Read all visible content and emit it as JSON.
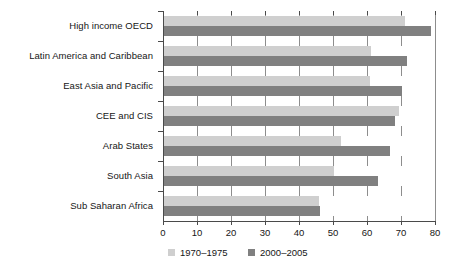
{
  "chart_data": {
    "type": "bar",
    "orientation": "horizontal",
    "title": "",
    "subtitle": "",
    "xlabel": "",
    "ylabel": "",
    "xlim": [
      0,
      80
    ],
    "ylim": null,
    "grid": true,
    "legend_position": "bottom",
    "xticks": [
      0,
      10,
      20,
      30,
      40,
      50,
      60,
      70,
      80
    ],
    "xtick_labels": [
      "0",
      "10",
      "20",
      "30",
      "40",
      "50",
      "60",
      "70",
      "80"
    ],
    "categories": [
      "High income OECD",
      "Latin America and Caribbean",
      "East Asia and Pacific",
      "CEE and CIS",
      "Arab States",
      "South Asia",
      "Sub Saharan Africa"
    ],
    "series": [
      {
        "name": "1970–1975",
        "color": "#cfcfcf",
        "values": [
          71.0,
          61.0,
          60.5,
          69.0,
          52.0,
          50.0,
          45.5
        ]
      },
      {
        "name": "2000–2005",
        "color": "#808080",
        "values": [
          78.5,
          71.5,
          70.0,
          68.0,
          66.5,
          63.0,
          46.0
        ]
      }
    ]
  },
  "legend": {
    "items": [
      {
        "label": "1970–1975",
        "swatch": "#cfcfcf"
      },
      {
        "label": "2000–2005",
        "swatch": "#808080"
      }
    ]
  }
}
